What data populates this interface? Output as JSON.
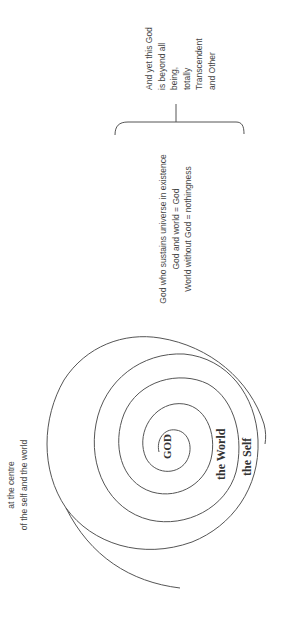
{
  "diagram": {
    "spiral_labels": {
      "center": "GOD",
      "ring2": "the World",
      "ring3": "the Self"
    },
    "note_center": {
      "lines": [
        "at the centre",
        "of the self and the world"
      ]
    },
    "note_immanent": {
      "lines": [
        "God who sustains universe in existence",
        "God and world = God",
        "World without God = nothingness"
      ]
    },
    "note_transcendent": {
      "lines": [
        "And yet this God",
        "is beyond all",
        "being,",
        "totally",
        "Transcendent",
        "and Other"
      ]
    },
    "colors": {
      "line": "#555555",
      "text": "#3a3a3a"
    }
  }
}
